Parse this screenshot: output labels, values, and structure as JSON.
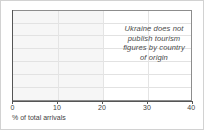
{
  "chart_data": {
    "type": "bar",
    "orientation": "horizontal",
    "title": "",
    "subtitle": "",
    "xlabel": "% of total arrivals",
    "ylabel": "",
    "xlim": [
      0,
      40
    ],
    "xticks": [
      0,
      10,
      20,
      30,
      40
    ],
    "xtick_labels": [
      "0",
      "10",
      "20",
      "30",
      "40"
    ],
    "categories": [],
    "values": [],
    "series": [],
    "grid": {
      "horizontal": true,
      "vertical": true,
      "horizontal_line_count": 7,
      "vertical_at": [
        10,
        20,
        30
      ]
    },
    "legend": null,
    "shaded_band": {
      "from": 0,
      "to": 20,
      "color": "#f6f6f6"
    },
    "annotations": [
      {
        "lines": [
          "Ukraine does not",
          "publish tourism",
          "figures by country",
          "of origin"
        ],
        "style": "italic",
        "align": "center",
        "x_range": [
          22,
          40
        ]
      }
    ],
    "note": "No data series plotted; chart area is empty."
  },
  "axis": {
    "x_title": "% of total arrivals",
    "ticks": [
      {
        "value": 0,
        "label": "0"
      },
      {
        "value": 10,
        "label": "10"
      },
      {
        "value": 20,
        "label": "20"
      },
      {
        "value": 30,
        "label": "30"
      },
      {
        "value": 40,
        "label": "40"
      }
    ]
  },
  "annotation": {
    "line1": "Ukraine does not",
    "line2": "publish tourism",
    "line3": "figures by country",
    "line4": "of origin"
  },
  "colors": {
    "figure_border": "#d2d2d2",
    "axis": "#555555",
    "gridline": "#e2e2e2",
    "band": "#f6f6f6",
    "text": "#3f3f3f",
    "annotation_text": "#4a4a4a"
  }
}
